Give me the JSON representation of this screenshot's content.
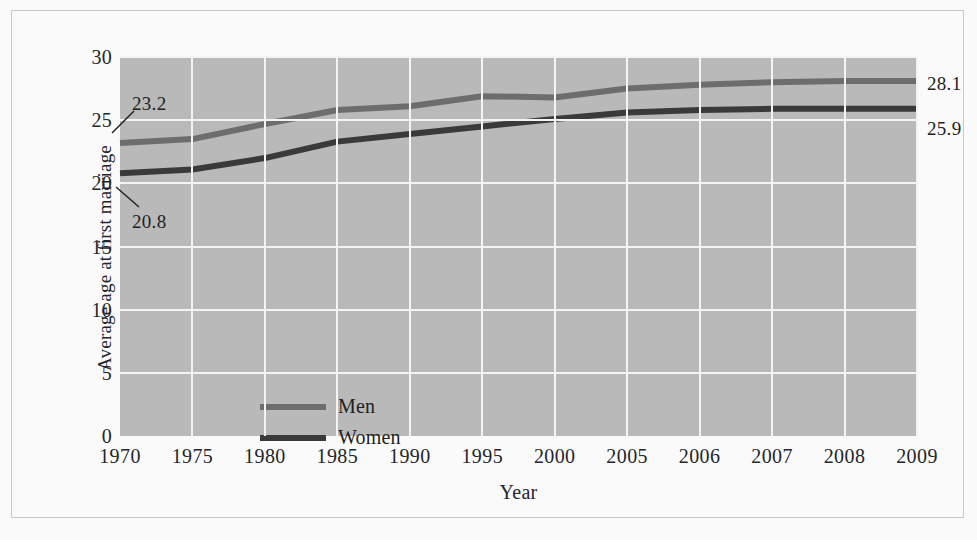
{
  "chart_data": {
    "type": "line",
    "title": "",
    "xlabel": "Year",
    "ylabel": "Average age at first marriage",
    "categories": [
      "1970",
      "1975",
      "1980",
      "1985",
      "1990",
      "1995",
      "2000",
      "2005",
      "2006",
      "2007",
      "2008",
      "2009"
    ],
    "series": [
      {
        "name": "Men",
        "color": "#6d6d6d",
        "values": [
          23.2,
          23.5,
          24.7,
          25.8,
          26.1,
          26.9,
          26.8,
          27.5,
          27.8,
          28.0,
          28.1,
          28.1
        ]
      },
      {
        "name": "Women",
        "color": "#3a3a3a",
        "values": [
          20.8,
          21.1,
          22.0,
          23.3,
          23.9,
          24.5,
          25.1,
          25.6,
          25.8,
          25.9,
          25.9,
          25.9
        ]
      }
    ],
    "ylim": [
      0,
      30
    ],
    "yticks": [
      "0",
      "5",
      "10",
      "15",
      "20",
      "25",
      "30"
    ],
    "ytick_values": [
      0,
      5,
      10,
      15,
      20,
      25,
      30
    ],
    "grid": true,
    "legend_position": "inside-lower-left",
    "plot_background": "#b9b9b9",
    "gridline_color": "#f4f4f4",
    "annotations": [
      {
        "id": "men-start",
        "text": "23.2",
        "series": "Men",
        "category": "1970",
        "value": 23.2
      },
      {
        "id": "women-start",
        "text": "20.8",
        "series": "Women",
        "category": "1970",
        "value": 20.8
      },
      {
        "id": "men-end",
        "text": "28.1",
        "series": "Men",
        "category": "2009",
        "value": 28.1
      },
      {
        "id": "women-end",
        "text": "25.9",
        "series": "Women",
        "category": "2009",
        "value": 25.9
      }
    ]
  }
}
